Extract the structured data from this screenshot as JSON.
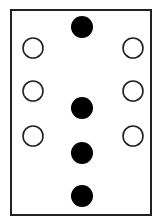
{
  "diagram": {
    "frame": {
      "x": 11,
      "y": 10,
      "width": 140,
      "height": 205,
      "stroke": "#222222",
      "stroke_width": 2
    },
    "colors": {
      "filled": "#000000",
      "outline": "#222222",
      "background": "#ffffff"
    },
    "hollow_circles": [
      {
        "id": "left-1",
        "cx": 33,
        "cy": 48,
        "r": 10
      },
      {
        "id": "right-1",
        "cx": 133,
        "cy": 48,
        "r": 10
      },
      {
        "id": "left-2",
        "cx": 33,
        "cy": 91,
        "r": 10
      },
      {
        "id": "right-2",
        "cx": 133,
        "cy": 91,
        "r": 10
      },
      {
        "id": "left-3",
        "cx": 33,
        "cy": 136,
        "r": 10
      },
      {
        "id": "right-3",
        "cx": 133,
        "cy": 136,
        "r": 10
      }
    ],
    "filled_circles": [
      {
        "id": "center-1",
        "cx": 82,
        "cy": 27,
        "r": 11
      },
      {
        "id": "center-2",
        "cx": 82,
        "cy": 108,
        "r": 11
      },
      {
        "id": "center-3",
        "cx": 82,
        "cy": 153,
        "r": 11
      },
      {
        "id": "center-4",
        "cx": 82,
        "cy": 196,
        "r": 11
      }
    ],
    "counts": {
      "hollow": 6,
      "filled": 4
    }
  }
}
